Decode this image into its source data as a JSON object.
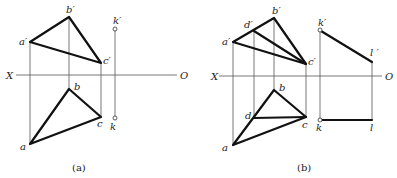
{
  "figure_a": {
    "caption": "(a)",
    "axis": {
      "left_label": "X",
      "right_label": "O"
    },
    "labels": {
      "a_prime": "a′",
      "b_prime": "b′",
      "c_prime": "c′",
      "k_prime": "k′",
      "a": "a",
      "b": "b",
      "c": "c",
      "k": "k"
    }
  },
  "figure_b": {
    "caption": "(b)",
    "axis": {
      "left_label": "X",
      "right_label": "O"
    },
    "labels": {
      "a_prime": "a′",
      "b_prime": "b′",
      "c_prime": "c′",
      "d_prime": "d′",
      "k_prime": "k′",
      "l_prime": "l ′",
      "a": "a",
      "b": "b",
      "c": "c",
      "d": "d",
      "k": "k",
      "l": "l"
    }
  }
}
